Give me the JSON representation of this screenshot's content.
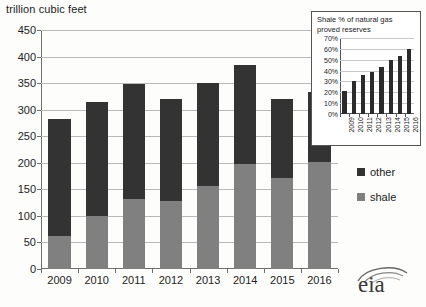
{
  "main": {
    "title": "trillion cubic feet",
    "y_ticks": [
      0,
      50,
      100,
      150,
      200,
      250,
      300,
      350,
      400,
      450
    ],
    "legend": [
      {
        "label": "other",
        "color": "#333333",
        "name": "other"
      },
      {
        "label": "shale",
        "color": "#808080",
        "name": "shale"
      }
    ],
    "logo_text": "eia"
  },
  "inset": {
    "title": "Shale % of natural gas proved reserves",
    "y_ticks": [
      "0%",
      "10%",
      "20%",
      "30%",
      "40%",
      "50%",
      "60%",
      "70%"
    ]
  },
  "chart_data": [
    {
      "type": "bar",
      "title": "trillion cubic feet",
      "subtitle": "",
      "xlabel": "",
      "ylabel": "trillion cubic feet",
      "ylim": [
        0,
        450
      ],
      "ytick_step": 50,
      "grid": true,
      "stacked": true,
      "legend_position": "right",
      "categories": [
        "2009",
        "2010",
        "2011",
        "2012",
        "2013",
        "2014",
        "2015",
        "2016"
      ],
      "series": [
        {
          "name": "shale",
          "color": "#808080",
          "values": [
            63,
            100,
            131,
            129,
            157,
            197,
            172,
            202
          ]
        },
        {
          "name": "other",
          "color": "#333333",
          "values": [
            220,
            215,
            218,
            191,
            194,
            188,
            148,
            131
          ]
        }
      ],
      "totals": [
        283,
        315,
        349,
        320,
        351,
        385,
        320,
        333
      ]
    },
    {
      "type": "bar",
      "title": "Shale % of natural gas proved reserves",
      "xlabel": "",
      "ylabel": "",
      "ylim": [
        0,
        70
      ],
      "ytick_step": 10,
      "ytick_labels": [
        "0%",
        "10%",
        "20%",
        "30%",
        "40%",
        "50%",
        "60%",
        "70%"
      ],
      "grid": true,
      "legend_position": "none",
      "categories": [
        "2009",
        "2010",
        "2011",
        "2012",
        "2013",
        "2014",
        "2015",
        "2016"
      ],
      "values": [
        21,
        30,
        36,
        39,
        43,
        50,
        53,
        60
      ],
      "color": "#2b2b2b"
    }
  ]
}
